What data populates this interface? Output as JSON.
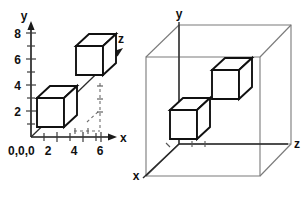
{
  "figure": {
    "background_color": "#ffffff",
    "line_color": "#111111",
    "box_color": "#7a7a7a"
  },
  "left_diagram": {
    "name": "open-axis-3d-plot",
    "axes": {
      "y_label": "y",
      "x_label": "x",
      "z_label": "z",
      "origin_label": "0,0,0"
    },
    "y_ticks": [
      "2",
      "4",
      "6",
      "8"
    ],
    "x_ticks": [
      "2",
      "4",
      "6"
    ],
    "y_tick_values": [
      2,
      4,
      6,
      8
    ],
    "x_tick_values": [
      2,
      4,
      6
    ],
    "cubes": [
      {
        "name": "near-cube",
        "x": 1,
        "y": 1,
        "z": 0,
        "size": 2
      },
      {
        "name": "far-cube",
        "x": 4,
        "y": 5,
        "z": 3,
        "size": 2
      }
    ]
  },
  "right_diagram": {
    "name": "bounding-box-3d-plot",
    "axes": {
      "y_label": "y",
      "x_label": "x",
      "z_label": "z"
    },
    "cubes": [
      {
        "name": "near-cube",
        "x": 1,
        "y": 1,
        "z": 0,
        "size": 2
      },
      {
        "name": "far-cube",
        "x": 4,
        "y": 5,
        "z": 3,
        "size": 2
      }
    ],
    "bounding_box": {
      "visible": true,
      "style": "wireframe"
    }
  }
}
